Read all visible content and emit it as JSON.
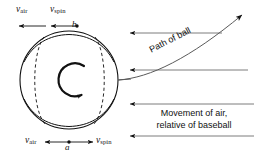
{
  "figure": {
    "background_color": "#ffffff",
    "stroke_color": "#111111",
    "width": 262,
    "height": 154
  },
  "ball": {
    "name": "baseball",
    "center_x": 69,
    "center_y": 80,
    "radius": 49,
    "spin_direction": "clockwise",
    "spin_icon": "rotation-arrow-clockwise",
    "seam_style": "dashed"
  },
  "labels": {
    "v_symbol": "v",
    "air_subscript": "air",
    "spin_subscript": "spin",
    "point_top": "b",
    "point_bottom": "a",
    "path_of_ball": "Path of ball",
    "air_movement_line1": "Movement of air,",
    "air_movement_line2": "relative of baseball"
  },
  "vectors": {
    "top": [
      {
        "name": "v-air-top",
        "label_symbol": "v",
        "label_sub": "air",
        "direction": "left",
        "origin_point": "b"
      },
      {
        "name": "v-spin-top",
        "label_symbol": "v",
        "label_sub": "spin",
        "direction": "left",
        "origin_point": "b"
      }
    ],
    "bottom": [
      {
        "name": "v-air-bottom",
        "label_symbol": "v",
        "label_sub": "air",
        "direction": "left",
        "origin_point": "a"
      },
      {
        "name": "v-spin-bottom",
        "label_symbol": "v",
        "label_sub": "spin",
        "direction": "right",
        "origin_point": "a"
      }
    ]
  },
  "airflow": {
    "arrow_count": 4,
    "direction": "left",
    "arrow_y_positions": [
      33,
      70,
      104,
      136
    ]
  },
  "path": {
    "name": "path-of-ball-curve",
    "direction": "up-right",
    "arrowhead": "end"
  }
}
